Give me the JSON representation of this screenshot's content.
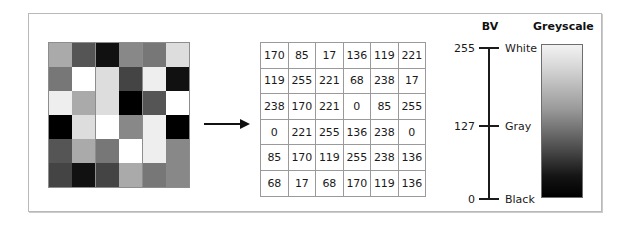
{
  "figure": {
    "raster": {
      "name": "greyscale-image-grid",
      "rows": 6,
      "cols": 6,
      "values": [
        [
          170,
          85,
          17,
          136,
          119,
          221
        ],
        [
          119,
          255,
          221,
          68,
          238,
          17
        ],
        [
          238,
          170,
          221,
          0,
          85,
          255
        ],
        [
          0,
          221,
          255,
          136,
          238,
          0
        ],
        [
          85,
          170,
          119,
          255,
          238,
          136
        ],
        [
          68,
          17,
          68,
          170,
          119,
          136
        ]
      ]
    },
    "matrix": {
      "name": "brightness-value-matrix",
      "rows": [
        [
          "170",
          "85",
          "17",
          "136",
          "119",
          "221"
        ],
        [
          "119",
          "255",
          "221",
          "68",
          "238",
          "17"
        ],
        [
          "238",
          "170",
          "221",
          "0",
          "85",
          "255"
        ],
        [
          "0",
          "221",
          "255",
          "136",
          "238",
          "0"
        ],
        [
          "85",
          "170",
          "119",
          "255",
          "238",
          "136"
        ],
        [
          "68",
          "17",
          "68",
          "170",
          "119",
          "136"
        ]
      ]
    },
    "arrow": {
      "name": "conversion-arrow",
      "direction": "right"
    },
    "bv_axis": {
      "title": "BV",
      "ticks": [
        {
          "value": "255",
          "label": "White",
          "top": 42
        },
        {
          "value": "127",
          "label": "Gray",
          "top": 120
        },
        {
          "value": "0",
          "label": "Black",
          "top": 193
        }
      ]
    },
    "greyscale": {
      "title": "Greyscale",
      "top_color": "#f2f2f2",
      "bottom_color": "#000000"
    }
  },
  "chart_data": {
    "type": "heatmap",
    "title": "",
    "xlabel": "",
    "ylabel": "",
    "categories": [
      "1",
      "2",
      "3",
      "4",
      "5",
      "6"
    ],
    "rows": 6,
    "cols": 6,
    "values": [
      [
        170,
        85,
        17,
        136,
        119,
        221
      ],
      [
        119,
        255,
        221,
        68,
        238,
        17
      ],
      [
        238,
        170,
        221,
        0,
        85,
        255
      ],
      [
        0,
        221,
        255,
        136,
        238,
        0
      ],
      [
        85,
        170,
        119,
        255,
        238,
        136
      ],
      [
        68,
        17,
        68,
        170,
        119,
        136
      ]
    ],
    "colormap": "greyscale",
    "vmin": 0,
    "vmax": 255,
    "legend": {
      "position": "right",
      "entries": [
        {
          "value": 255,
          "label": "White"
        },
        {
          "value": 127,
          "label": "Gray"
        },
        {
          "value": 0,
          "label": "Black"
        }
      ]
    },
    "grid": true
  }
}
